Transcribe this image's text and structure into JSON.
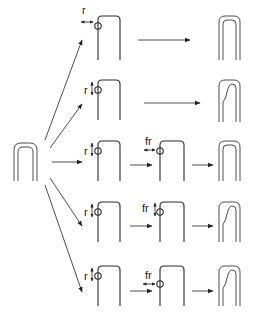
{
  "diagram": {
    "type": "process-flow",
    "source_shape": "double-walled-hairpin",
    "rows": [
      {
        "index": 1,
        "steps": [
          {
            "kind": "open-hairpin-with-circle",
            "label": "r",
            "arrow_dir": "horizontal"
          },
          {
            "kind": "final",
            "result": "double-walled-hairpin"
          }
        ]
      },
      {
        "index": 2,
        "steps": [
          {
            "kind": "open-hairpin-with-circle",
            "label": "r",
            "arrow_dir": "vertical"
          },
          {
            "kind": "final",
            "result": "deformed-double-walled-hairpin"
          }
        ]
      },
      {
        "index": 3,
        "steps": [
          {
            "kind": "open-hairpin-with-circle",
            "label": "r",
            "arrow_dir": "vertical"
          },
          {
            "kind": "open-hairpin-with-circle",
            "label": "fr",
            "arrow_dir": "horizontal"
          },
          {
            "kind": "final",
            "result": "double-walled-hairpin"
          }
        ]
      },
      {
        "index": 4,
        "steps": [
          {
            "kind": "open-hairpin-with-circle",
            "label": "r",
            "arrow_dir": "vertical"
          },
          {
            "kind": "open-hairpin-with-circle",
            "label": "fr",
            "arrow_dir": "vertical"
          },
          {
            "kind": "final",
            "result": "deformed-double-walled-hairpin"
          }
        ]
      },
      {
        "index": 5,
        "steps": [
          {
            "kind": "open-hairpin-with-circle",
            "label": "r",
            "arrow_dir": "vertical"
          },
          {
            "kind": "open-hairpin-with-circle",
            "label": "fr",
            "arrow_dir": "horizontal"
          },
          {
            "kind": "final",
            "result": "deformed-double-walled-hairpin"
          }
        ]
      }
    ],
    "labels": {
      "r": "r",
      "fr": "fr"
    }
  }
}
